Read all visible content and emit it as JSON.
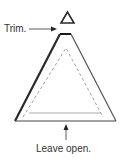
{
  "diagram": {
    "labels": {
      "trim": "Trim.",
      "leave_open": "Leave open."
    },
    "colors": {
      "stroke_dark": "#2a2a2a",
      "stroke_mid": "#555555",
      "dashed": "#888888",
      "inner_line": "#aaaaaa",
      "text": "#333333"
    }
  }
}
